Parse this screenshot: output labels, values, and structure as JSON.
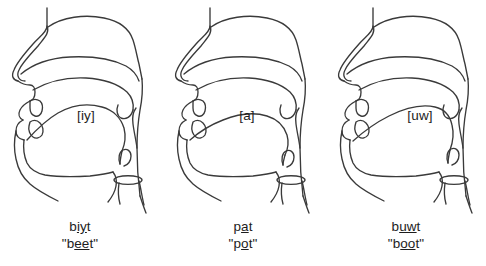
{
  "figure": {
    "background_color": "#ffffff",
    "line_color": "#3a3a3a",
    "text_color": "#1d1d1d"
  },
  "panels": [
    {
      "phoneme_label": "[iy]",
      "phoneme": "iy",
      "transcription": {
        "full": "biyt",
        "before": "b",
        "underlined": "iy",
        "after": "t"
      },
      "word": {
        "full": "\"beet\"",
        "before": "\"b",
        "underlined": "ee",
        "after": "t\""
      },
      "articulation": "high front unrounded vowel"
    },
    {
      "phoneme_label": "[a]",
      "phoneme": "a",
      "transcription": {
        "full": "pat",
        "before": "p",
        "underlined": "a",
        "after": "t"
      },
      "word": {
        "full": "\"pot\"",
        "before": "\"p",
        "underlined": "o",
        "after": "t\""
      },
      "articulation": "low back unrounded vowel"
    },
    {
      "phoneme_label": "[uw]",
      "phoneme": "uw",
      "transcription": {
        "full": "buwt",
        "before": "b",
        "underlined": "uw",
        "after": "t"
      },
      "word": {
        "full": "\"boot\"",
        "before": "\"b",
        "underlined": "oo",
        "after": "t\""
      },
      "articulation": "high back rounded vowel"
    }
  ]
}
